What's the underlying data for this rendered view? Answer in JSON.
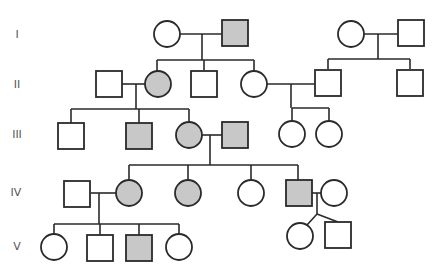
{
  "chart_data": {
    "type": "pedigree",
    "title": "",
    "generations": [
      "I",
      "II",
      "III",
      "IV",
      "V"
    ],
    "legend": {
      "affected_fill": "#c8c8c8",
      "unaffected_fill": "#ffffff",
      "stroke": "#2a2a2a"
    },
    "individuals": [
      {
        "id": "I-1",
        "gen": "I",
        "sex": "female",
        "affected": false,
        "x": 167,
        "y": 34
      },
      {
        "id": "I-2",
        "gen": "I",
        "sex": "male",
        "affected": true,
        "x": 235,
        "y": 33
      },
      {
        "id": "I-3",
        "gen": "I",
        "sex": "female",
        "affected": false,
        "x": 351,
        "y": 34
      },
      {
        "id": "I-4",
        "gen": "I",
        "sex": "male",
        "affected": false,
        "x": 411,
        "y": 33
      },
      {
        "id": "II-1",
        "gen": "II",
        "sex": "male",
        "affected": false,
        "x": 109,
        "y": 84
      },
      {
        "id": "II-2",
        "gen": "II",
        "sex": "female",
        "affected": true,
        "x": 158,
        "y": 84
      },
      {
        "id": "II-3",
        "gen": "II",
        "sex": "male",
        "affected": false,
        "x": 204,
        "y": 84
      },
      {
        "id": "II-4",
        "gen": "II",
        "sex": "female",
        "affected": false,
        "x": 254,
        "y": 84
      },
      {
        "id": "II-5",
        "gen": "II",
        "sex": "male",
        "affected": false,
        "x": 328,
        "y": 83
      },
      {
        "id": "II-6",
        "gen": "II",
        "sex": "male",
        "affected": false,
        "x": 410,
        "y": 83
      },
      {
        "id": "III-1",
        "gen": "III",
        "sex": "male",
        "affected": false,
        "x": 71,
        "y": 136
      },
      {
        "id": "III-2",
        "gen": "III",
        "sex": "male",
        "affected": true,
        "x": 139,
        "y": 136
      },
      {
        "id": "III-3",
        "gen": "III",
        "sex": "female",
        "affected": true,
        "x": 189,
        "y": 135
      },
      {
        "id": "III-4",
        "gen": "III",
        "sex": "male",
        "affected": true,
        "x": 235,
        "y": 135
      },
      {
        "id": "III-5",
        "gen": "III",
        "sex": "female",
        "affected": false,
        "x": 292,
        "y": 134
      },
      {
        "id": "III-6",
        "gen": "III",
        "sex": "female",
        "affected": false,
        "x": 329,
        "y": 134
      },
      {
        "id": "IV-1",
        "gen": "IV",
        "sex": "male",
        "affected": false,
        "x": 77,
        "y": 194
      },
      {
        "id": "IV-2",
        "gen": "IV",
        "sex": "female",
        "affected": true,
        "x": 129,
        "y": 193
      },
      {
        "id": "IV-3",
        "gen": "IV",
        "sex": "female",
        "affected": true,
        "x": 188,
        "y": 193
      },
      {
        "id": "IV-4",
        "gen": "IV",
        "sex": "female",
        "affected": false,
        "x": 251,
        "y": 193
      },
      {
        "id": "IV-5",
        "gen": "IV",
        "sex": "male",
        "affected": true,
        "x": 299,
        "y": 193
      },
      {
        "id": "IV-6",
        "gen": "IV",
        "sex": "female",
        "affected": false,
        "x": 334,
        "y": 193
      },
      {
        "id": "V-1",
        "gen": "V",
        "sex": "female",
        "affected": false,
        "x": 54,
        "y": 247
      },
      {
        "id": "V-2",
        "gen": "V",
        "sex": "male",
        "affected": false,
        "x": 100,
        "y": 248
      },
      {
        "id": "V-3",
        "gen": "V",
        "sex": "male",
        "affected": true,
        "x": 139,
        "y": 248
      },
      {
        "id": "V-4",
        "gen": "V",
        "sex": "female",
        "affected": false,
        "x": 179,
        "y": 247
      },
      {
        "id": "V-5",
        "gen": "V",
        "sex": "female",
        "affected": false,
        "x": 300,
        "y": 236,
        "twin": true
      },
      {
        "id": "V-6",
        "gen": "V",
        "sex": "male",
        "affected": false,
        "x": 338,
        "y": 235,
        "twin": true
      }
    ],
    "lines": [
      [
        180,
        34,
        222,
        34
      ],
      [
        202,
        34,
        202,
        60
      ],
      [
        157,
        60,
        254,
        60
      ],
      [
        157,
        60,
        157,
        71
      ],
      [
        204,
        60,
        204,
        70
      ],
      [
        254,
        60,
        254,
        71
      ],
      [
        364,
        34,
        398,
        34
      ],
      [
        378,
        34,
        378,
        59
      ],
      [
        328,
        59,
        410,
        59
      ],
      [
        328,
        59,
        328,
        69
      ],
      [
        410,
        59,
        410,
        69
      ],
      [
        122,
        84,
        145,
        84
      ],
      [
        136,
        84,
        136,
        109
      ],
      [
        71,
        109,
        189,
        109
      ],
      [
        71,
        109,
        71,
        123
      ],
      [
        139,
        109,
        139,
        123
      ],
      [
        189,
        109,
        189,
        122
      ],
      [
        267,
        84,
        316,
        84
      ],
      [
        291,
        84,
        291,
        108
      ],
      [
        292,
        108,
        329,
        108
      ],
      [
        292,
        108,
        292,
        121
      ],
      [
        329,
        108,
        329,
        121
      ],
      [
        202,
        135,
        222,
        135
      ],
      [
        210,
        135,
        210,
        165
      ],
      [
        129,
        165,
        298,
        165
      ],
      [
        129,
        165,
        129,
        180
      ],
      [
        188,
        165,
        188,
        180
      ],
      [
        251,
        165,
        251,
        180
      ],
      [
        298,
        165,
        298,
        180
      ],
      [
        91,
        193,
        116,
        193
      ],
      [
        99,
        193,
        99,
        224
      ],
      [
        54,
        224,
        179,
        224
      ],
      [
        54,
        224,
        54,
        234
      ],
      [
        100,
        224,
        100,
        236
      ],
      [
        139,
        224,
        139,
        236
      ],
      [
        179,
        224,
        179,
        234
      ],
      [
        312,
        193,
        321,
        193
      ],
      [
        317,
        193,
        317,
        214
      ],
      [
        317,
        214,
        307,
        225
      ],
      [
        317,
        214,
        338,
        222
      ]
    ],
    "symbol_size": {
      "circle_radius": 13,
      "square_half": 13
    }
  },
  "labels": {
    "gen_I": "I",
    "gen_II": "II",
    "gen_III": "III",
    "gen_IV": "IV",
    "gen_V": "V"
  }
}
